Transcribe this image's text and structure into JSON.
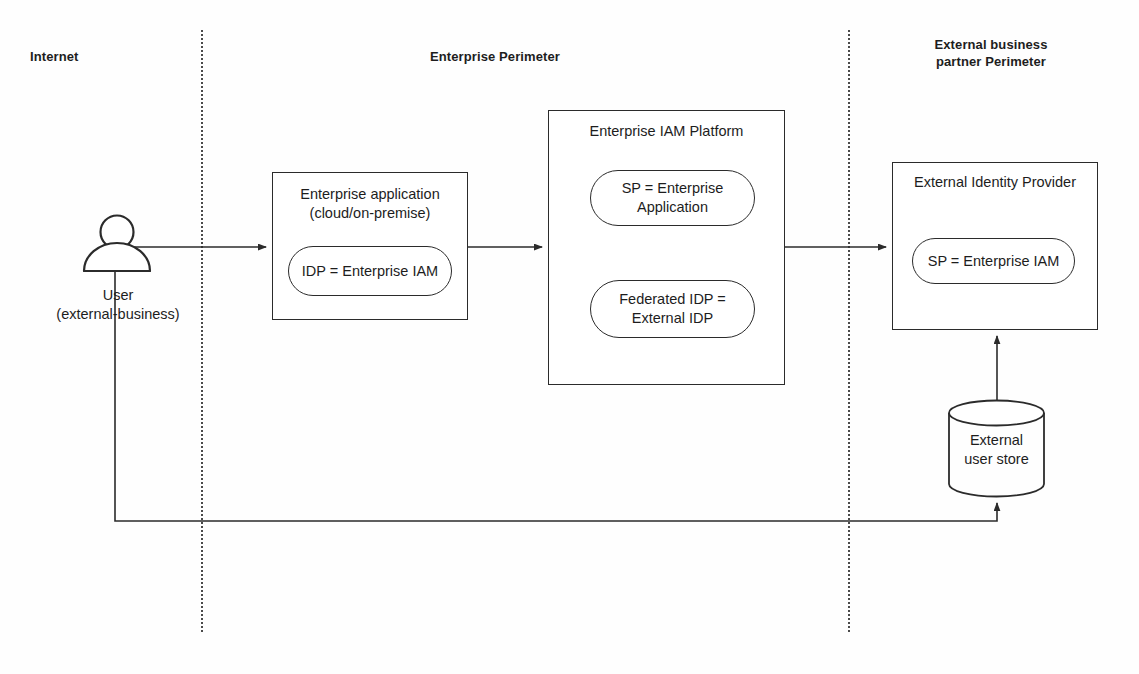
{
  "diagram": {
    "background": "#ffffff",
    "line_color": "#2b2b2b"
  },
  "zones": [
    {
      "id": "internet",
      "label": "Internet"
    },
    {
      "id": "enterprise_perimeter",
      "label": "Enterprise Perimeter"
    },
    {
      "id": "external_partner_perimeter",
      "label": "External business\npartner Perimeter"
    }
  ],
  "dividers": [
    {
      "id": "internet-enterprise",
      "style": "dotted-vertical"
    },
    {
      "id": "enterprise-external",
      "style": "dotted-vertical"
    }
  ],
  "actors": [
    {
      "id": "user",
      "icon": "user-icon",
      "label": "User\n(external-business)"
    }
  ],
  "nodes": [
    {
      "id": "enterprise_application",
      "title": "Enterprise application\n(cloud/on-premise)",
      "zone": "enterprise_perimeter",
      "children": [
        {
          "id": "idp_enterprise_iam",
          "label": "IDP = Enterprise IAM",
          "shape": "pill"
        }
      ]
    },
    {
      "id": "enterprise_iam_platform",
      "title": "Enterprise IAM Platform",
      "zone": "enterprise_perimeter",
      "children": [
        {
          "id": "sp_enterprise_application",
          "label": "SP = Enterprise\nApplication",
          "shape": "pill"
        },
        {
          "id": "federated_idp_external_idp",
          "label": "Federated IDP =\nExternal IDP",
          "shape": "pill"
        }
      ]
    },
    {
      "id": "external_identity_provider",
      "title": "External Identity Provider",
      "zone": "external_partner_perimeter",
      "children": [
        {
          "id": "sp_enterprise_iam",
          "label": "SP = Enterprise IAM",
          "shape": "pill"
        }
      ]
    }
  ],
  "datastores": [
    {
      "id": "external_user_store",
      "label": "External\nuser store",
      "shape": "cylinder"
    }
  ],
  "connections": [
    {
      "from": "user",
      "to": "enterprise_application",
      "arrow": "end",
      "style": "solid"
    },
    {
      "from": "enterprise_application",
      "to": "enterprise_iam_platform",
      "arrow": "end",
      "style": "solid"
    },
    {
      "from": "enterprise_iam_platform",
      "to": "external_identity_provider",
      "arrow": "end",
      "style": "solid"
    },
    {
      "from": "external_user_store",
      "to": "external_identity_provider",
      "arrow": "end",
      "style": "solid"
    },
    {
      "from": "user",
      "to": "external_user_store",
      "arrow": "end",
      "style": "solid-orthogonal"
    }
  ]
}
